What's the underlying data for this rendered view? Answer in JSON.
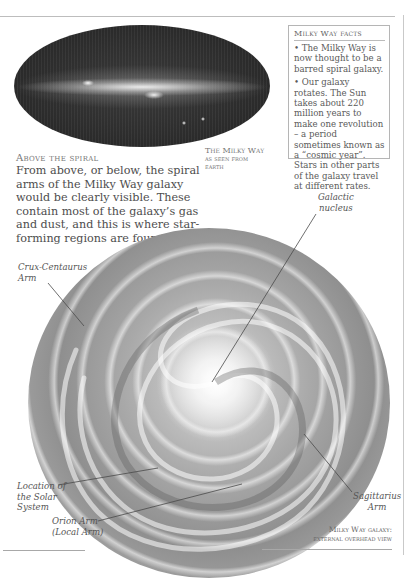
{
  "sky_map": {
    "caption_line1": "The Milky Way",
    "caption_line2": "as seen from",
    "caption_line3": "earth"
  },
  "facts_box": {
    "title": "Milky Way facts",
    "items": [
      "• The Milky Way is now thought to be a barred spiral galaxy.",
      "• Our galaxy rotates. The Sun takes about 220 million years to make one revolution – a period sometimes known as a “cosmic year”. Stars in other parts of the galaxy travel at different rates."
    ]
  },
  "section": {
    "heading": "Above the spiral",
    "body": "From above, or below, the spiral arms of the Milky Way galaxy would be clearly visible. These contain most of the galaxy’s gas and dust, and this is where star-forming regions are found."
  },
  "galaxy_labels": {
    "nucleus_line1": "Galactic",
    "nucleus_line2": "nucleus",
    "crux_line1": "Crux-Centaurus",
    "crux_line2": "Arm",
    "solar_line1": "Location of",
    "solar_line2": "the Solar",
    "solar_line3": "System",
    "orion_line1": "Orion Arm",
    "orion_line2": "(Local Arm)",
    "sag_line1": "Sagittarius",
    "sag_line2": "Arm"
  },
  "galaxy_caption": {
    "line1": "Milky Way galaxy:",
    "line2": "external overhead view"
  }
}
